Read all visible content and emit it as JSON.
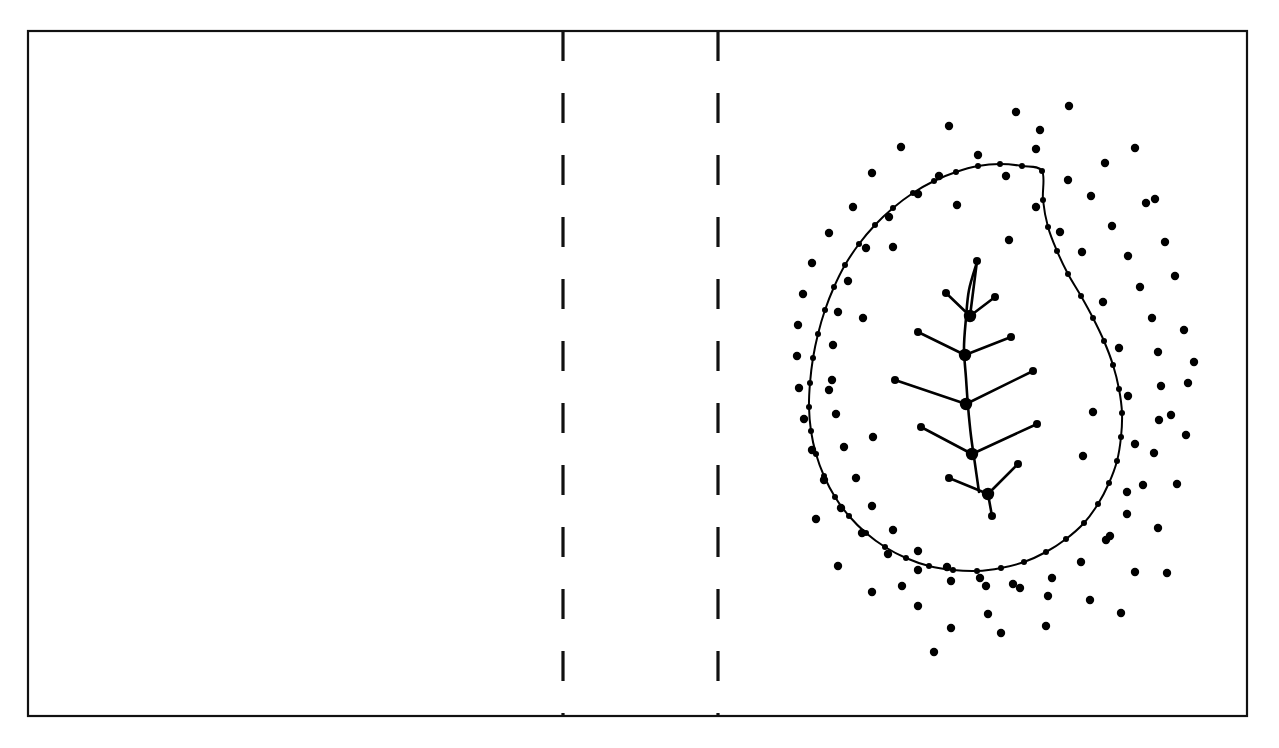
{
  "figure": {
    "title": "Leaf shape with medial-axis skeleton and exterior sample point cloud",
    "background_color": "#ffffff",
    "stroke_color": "#000000",
    "width": 1279,
    "height": 748
  },
  "frame": {
    "name": "outer-border",
    "x": 28,
    "y": 31,
    "width": 1219,
    "height": 685,
    "stroke_width": 2.2,
    "color": "#111111"
  },
  "dividers": [
    {
      "label": "divider-1",
      "x": 563,
      "y1": 31,
      "y2": 716,
      "dash": 30,
      "gap": 32,
      "stroke_width": 3.2,
      "color": "#111111"
    },
    {
      "label": "divider-2",
      "x": 718,
      "y1": 31,
      "y2": 716,
      "dash": 30,
      "gap": 32,
      "stroke_width": 3.2,
      "color": "#111111"
    }
  ],
  "panels": [
    {
      "label": "panel-left",
      "x": 28,
      "y": 31,
      "width": 535,
      "height": 685,
      "content": "empty"
    },
    {
      "label": "panel-middle",
      "x": 563,
      "y": 31,
      "width": 155,
      "height": 685,
      "content": "empty"
    },
    {
      "label": "panel-right",
      "x": 718,
      "y": 31,
      "width": 529,
      "height": 685,
      "content": "leaf-diagram"
    }
  ],
  "chart_data": {
    "type": "scatter",
    "xlabel": "",
    "ylabel": "",
    "xlim": [
      718,
      1247
    ],
    "ylim": [
      31,
      716
    ],
    "grid": false,
    "legend": "none",
    "contour": {
      "name": "leaf-outline",
      "closed": true,
      "stroke_width": 2.0,
      "color": "#000000",
      "points": [
        [
          1042,
          171
        ],
        [
          1022,
          166
        ],
        [
          1000,
          164
        ],
        [
          978,
          166
        ],
        [
          956,
          172
        ],
        [
          934,
          181
        ],
        [
          913,
          193
        ],
        [
          893,
          208
        ],
        [
          875,
          225
        ],
        [
          859,
          244
        ],
        [
          845,
          265
        ],
        [
          834,
          287
        ],
        [
          825,
          310
        ],
        [
          818,
          334
        ],
        [
          813,
          358
        ],
        [
          810,
          383
        ],
        [
          809,
          407
        ],
        [
          811,
          431
        ],
        [
          816,
          454
        ],
        [
          824,
          476
        ],
        [
          835,
          497
        ],
        [
          849,
          516
        ],
        [
          866,
          533
        ],
        [
          885,
          547
        ],
        [
          906,
          558
        ],
        [
          929,
          566
        ],
        [
          953,
          570
        ],
        [
          977,
          571
        ],
        [
          1001,
          568
        ],
        [
          1024,
          562
        ],
        [
          1046,
          552
        ],
        [
          1066,
          539
        ],
        [
          1084,
          523
        ],
        [
          1098,
          504
        ],
        [
          1109,
          483
        ],
        [
          1117,
          461
        ],
        [
          1121,
          437
        ],
        [
          1122,
          413
        ],
        [
          1119,
          389
        ],
        [
          1113,
          365
        ],
        [
          1104,
          341
        ],
        [
          1093,
          318
        ],
        [
          1081,
          296
        ],
        [
          1068,
          274
        ],
        [
          1057,
          251
        ],
        [
          1048,
          227
        ],
        [
          1043,
          200
        ]
      ]
    },
    "contour_samples": {
      "name": "contour-sample-points",
      "radius": 3.0,
      "color": "#000000",
      "count": 47,
      "note": "Small filled dots placed at every contour vertex"
    },
    "skeleton": {
      "name": "leaf-vein-skeleton",
      "stroke_width": 2.6,
      "color": "#000000",
      "major_node_radius": 6.2,
      "tip_node_radius": 4.0,
      "midrib": [
        [
          977,
          262
        ],
        [
          969,
          290
        ],
        [
          966,
          318
        ],
        [
          964,
          348
        ],
        [
          966,
          378
        ],
        [
          968,
          406
        ],
        [
          971,
          436
        ],
        [
          975,
          464
        ],
        [
          979,
          492
        ]
      ],
      "major_nodes": [
        {
          "id": "n1",
          "x": 970,
          "y": 316
        },
        {
          "id": "n2",
          "x": 965,
          "y": 355
        },
        {
          "id": "n3",
          "x": 966,
          "y": 404
        },
        {
          "id": "n4",
          "x": 972,
          "y": 454
        },
        {
          "id": "n5",
          "x": 988,
          "y": 494
        }
      ],
      "branches": [
        {
          "from": "n1",
          "to": [
            946,
            293
          ],
          "tip": true
        },
        {
          "from": "n1",
          "to": [
            995,
            297
          ],
          "tip": true
        },
        {
          "from": "n1",
          "to": [
            977,
            261
          ],
          "tip": true
        },
        {
          "from": "n2",
          "to": [
            918,
            332
          ],
          "tip": true
        },
        {
          "from": "n2",
          "to": [
            1011,
            337
          ],
          "tip": true
        },
        {
          "from": "n3",
          "to": [
            895,
            380
          ],
          "tip": true
        },
        {
          "from": "n3",
          "to": [
            1033,
            371
          ],
          "tip": true
        },
        {
          "from": "n4",
          "to": [
            921,
            427
          ],
          "tip": true
        },
        {
          "from": "n4",
          "to": [
            1037,
            424
          ],
          "tip": true
        },
        {
          "from": "n5",
          "to": [
            949,
            478
          ],
          "tip": true
        },
        {
          "from": "n5",
          "to": [
            1018,
            464
          ],
          "tip": true
        },
        {
          "from": "n5",
          "to": [
            992,
            516
          ],
          "tip": true
        }
      ]
    },
    "exterior_cloud": {
      "name": "exterior-sample-cloud",
      "radius": 4.2,
      "color": "#000000",
      "count": 103,
      "points": [
        [
          1016,
          112
        ],
        [
          1069,
          106
        ],
        [
          949,
          126
        ],
        [
          901,
          147
        ],
        [
          1135,
          148
        ],
        [
          1036,
          149
        ],
        [
          978,
          155
        ],
        [
          1105,
          163
        ],
        [
          872,
          173
        ],
        [
          939,
          176
        ],
        [
          1006,
          176
        ],
        [
          1068,
          180
        ],
        [
          853,
          207
        ],
        [
          918,
          194
        ],
        [
          1091,
          196
        ],
        [
          1146,
          203
        ],
        [
          829,
          233
        ],
        [
          889,
          217
        ],
        [
          1112,
          226
        ],
        [
          1036,
          207
        ],
        [
          812,
          263
        ],
        [
          866,
          248
        ],
        [
          1128,
          256
        ],
        [
          1165,
          242
        ],
        [
          803,
          294
        ],
        [
          848,
          281
        ],
        [
          1140,
          287
        ],
        [
          1082,
          252
        ],
        [
          798,
          325
        ],
        [
          838,
          312
        ],
        [
          1152,
          318
        ],
        [
          1175,
          276
        ],
        [
          797,
          356
        ],
        [
          833,
          345
        ],
        [
          1158,
          352
        ],
        [
          1103,
          302
        ],
        [
          799,
          388
        ],
        [
          832,
          380
        ],
        [
          1161,
          386
        ],
        [
          1184,
          330
        ],
        [
          804,
          419
        ],
        [
          836,
          414
        ],
        [
          1159,
          420
        ],
        [
          1119,
          348
        ],
        [
          812,
          450
        ],
        [
          844,
          447
        ],
        [
          1154,
          453
        ],
        [
          1188,
          383
        ],
        [
          824,
          480
        ],
        [
          856,
          478
        ],
        [
          1143,
          485
        ],
        [
          1128,
          396
        ],
        [
          841,
          508
        ],
        [
          872,
          506
        ],
        [
          1127,
          514
        ],
        [
          1186,
          435
        ],
        [
          862,
          533
        ],
        [
          893,
          530
        ],
        [
          1106,
          540
        ],
        [
          1135,
          444
        ],
        [
          888,
          554
        ],
        [
          918,
          551
        ],
        [
          1081,
          562
        ],
        [
          1177,
          484
        ],
        [
          918,
          570
        ],
        [
          947,
          567
        ],
        [
          1052,
          578
        ],
        [
          1127,
          492
        ],
        [
          951,
          581
        ],
        [
          980,
          578
        ],
        [
          1020,
          588
        ],
        [
          1158,
          528
        ],
        [
          986,
          586
        ],
        [
          1013,
          584
        ],
        [
          988,
          614
        ],
        [
          1110,
          536
        ],
        [
          918,
          606
        ],
        [
          872,
          592
        ],
        [
          1048,
          596
        ],
        [
          1135,
          572
        ],
        [
          838,
          566
        ],
        [
          1046,
          626
        ],
        [
          951,
          628
        ],
        [
          1001,
          633
        ],
        [
          1090,
          600
        ],
        [
          1167,
          573
        ],
        [
          816,
          519
        ],
        [
          1171,
          415
        ],
        [
          1194,
          362
        ],
        [
          1155,
          199
        ],
        [
          1040,
          130
        ],
        [
          957,
          205
        ],
        [
          893,
          247
        ],
        [
          1060,
          232
        ],
        [
          829,
          390
        ],
        [
          1083,
          456
        ],
        [
          902,
          586
        ],
        [
          1009,
          240
        ],
        [
          1093,
          412
        ],
        [
          873,
          437
        ],
        [
          863,
          318
        ],
        [
          1121,
          613
        ],
        [
          934,
          652
        ]
      ]
    }
  },
  "annotations": {
    "visible_text": []
  }
}
